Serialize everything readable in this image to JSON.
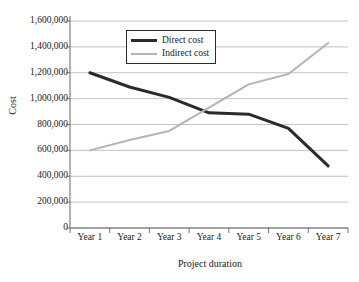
{
  "chart_data": {
    "type": "line",
    "title": "",
    "xlabel": "Project duration",
    "ylabel": "Cost",
    "categories": [
      "Year 1",
      "Year 2",
      "Year 3",
      "Year 4",
      "Year 5",
      "Year 6",
      "Year 7"
    ],
    "ylim": [
      0,
      1600000
    ],
    "ytick_values": [
      0,
      200000,
      400000,
      600000,
      800000,
      1000000,
      1200000,
      1400000,
      1600000
    ],
    "ytick_labels": [
      "0",
      "200,000",
      "400,000",
      "600,000",
      "800,000",
      "1,000,000",
      "1,200,000",
      "1,400,000",
      "1,600,000"
    ],
    "grid": true,
    "legend_position": "top-center",
    "series": [
      {
        "name": "Direct cost",
        "color": "#2b2b2b",
        "width": 3,
        "values": [
          1200000,
          1090000,
          1010000,
          890000,
          880000,
          770000,
          480000
        ]
      },
      {
        "name": "Indirect cost",
        "color": "#b4b4b4",
        "width": 2,
        "values": [
          600000,
          680000,
          750000,
          930000,
          1110000,
          1190000,
          1430000
        ]
      }
    ]
  },
  "legend": {
    "direct_label": "Direct cost",
    "indirect_label": "Indirect cost"
  }
}
